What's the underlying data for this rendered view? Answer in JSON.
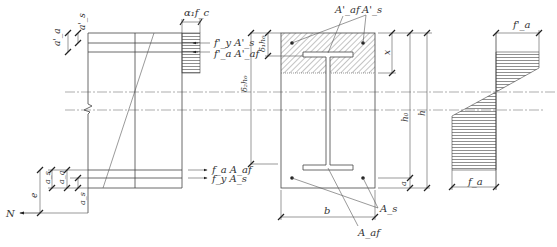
{
  "figure": {
    "colors": {
      "line": "#444444",
      "hatch": "#555555",
      "background": "#ffffff"
    }
  },
  "elevation": {
    "labels": {
      "alpha1_fc": "α₁f_c",
      "fy_As_prime": "f'_y A'_s",
      "fa_Aaf_prime": "f'_a A'_af",
      "fa_Aaf": "f_a A_af",
      "fy_As": "f_y A_s",
      "N": "N",
      "e": "e",
      "a_a_prime": "a'_a",
      "a_s_prime": "a'_s",
      "a_s": "a_s",
      "a_a": "a_a",
      "a_s_bottom": "a_s"
    }
  },
  "section": {
    "labels": {
      "A_af_prime": "A'_af",
      "A_s_prime": "A'_s",
      "A_s": "A_s",
      "A_af": "A_af",
      "b": "b",
      "x": "x",
      "h0": "h₀",
      "h": "h",
      "a": "a",
      "delta1_h0": "δ₁h₀",
      "delta2_h0": "δ₂h₀"
    }
  },
  "stress_diagram": {
    "labels": {
      "fa_prime": "f'_a",
      "fa": "f_a"
    }
  }
}
